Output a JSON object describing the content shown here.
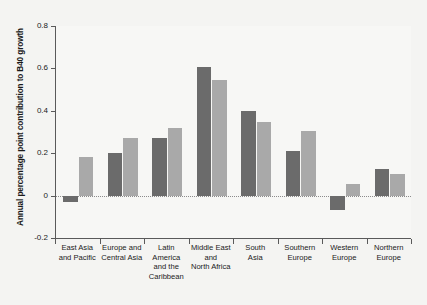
{
  "chart_data": {
    "type": "bar",
    "title": "",
    "xlabel": "",
    "ylabel": "Annual percentage point contribution to B40 growth",
    "ylim": [
      -0.2,
      0.8
    ],
    "yticks": [
      0.8,
      0.6,
      0.4,
      0.2,
      0,
      -0.2
    ],
    "ytick_labels": [
      "0.8",
      "0.6",
      "0.4",
      "0.2",
      "0",
      "-0.2"
    ],
    "grid": false,
    "legend": "none",
    "zero_reference_line": true,
    "categories": [
      "East Asia and Pacific",
      "Europe and Central Asia",
      "Latin America and the Caribbean",
      "Middle East and North Africa",
      "South Asia",
      "Southern Europe",
      "Western Europe",
      "Northern Europe"
    ],
    "category_label_lines": [
      [
        "East Asia",
        "and Pacific"
      ],
      [
        "Europe and",
        "Central Asia"
      ],
      [
        "Latin",
        "America",
        "and the",
        "Caribbean"
      ],
      [
        "Middle East",
        "and",
        "North Africa"
      ],
      [
        "South",
        "Asia"
      ],
      [
        "Southern",
        "Europe"
      ],
      [
        "Western",
        "Europe"
      ],
      [
        "Northern",
        "Europe"
      ]
    ],
    "series": [
      {
        "name": "series-1",
        "color": "#6b6b6b",
        "values": [
          -0.03,
          0.2,
          0.27,
          0.605,
          0.4,
          0.21,
          -0.07,
          0.125
        ]
      },
      {
        "name": "series-2",
        "color": "#a9a9a9",
        "values": [
          0.18,
          0.27,
          0.32,
          0.545,
          0.345,
          0.305,
          0.055,
          0.1
        ]
      }
    ]
  },
  "figure": {
    "background_color": "#f4f4f2",
    "plot_background_color": "#f7f7f5",
    "axis_color": "#5a5a5a"
  }
}
